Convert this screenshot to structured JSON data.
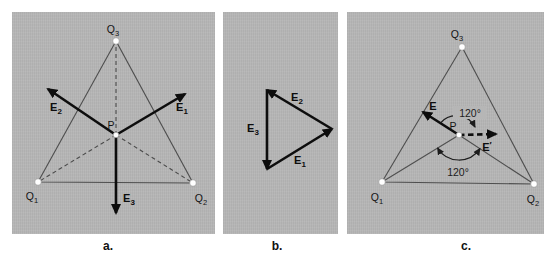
{
  "colors": {
    "panel_background": "#b6b6b6",
    "thin_line": "#4f4f4f",
    "vector": "#0d0d0d",
    "text": "#141414"
  },
  "captions": {
    "a": "a.",
    "b": "b.",
    "c": "c."
  },
  "panel_a": {
    "charge_q3": {
      "main": "Q",
      "sub": "3"
    },
    "charge_q1": {
      "main": "Q",
      "sub": "1"
    },
    "charge_q2": {
      "main": "Q",
      "sub": "2"
    },
    "point_p": "P",
    "vector_e1": {
      "main": "E",
      "sub": "1"
    },
    "vector_e2": {
      "main": "E",
      "sub": "2"
    },
    "vector_e3": {
      "main": "E",
      "sub": "3"
    }
  },
  "panel_b": {
    "vector_e1": {
      "main": "E",
      "sub": "1"
    },
    "vector_e2": {
      "main": "E",
      "sub": "2"
    },
    "vector_e3": {
      "main": "E",
      "sub": "3"
    }
  },
  "panel_c": {
    "charge_q3": {
      "main": "Q",
      "sub": "3"
    },
    "charge_q1": {
      "main": "Q",
      "sub": "1"
    },
    "charge_q2": {
      "main": "Q",
      "sub": "2"
    },
    "point_p": "P",
    "vector_e": {
      "main": "E"
    },
    "vector_e_prime": {
      "main": "E",
      "prime": "′"
    },
    "angle_upper": "120°",
    "angle_lower": "120°"
  }
}
